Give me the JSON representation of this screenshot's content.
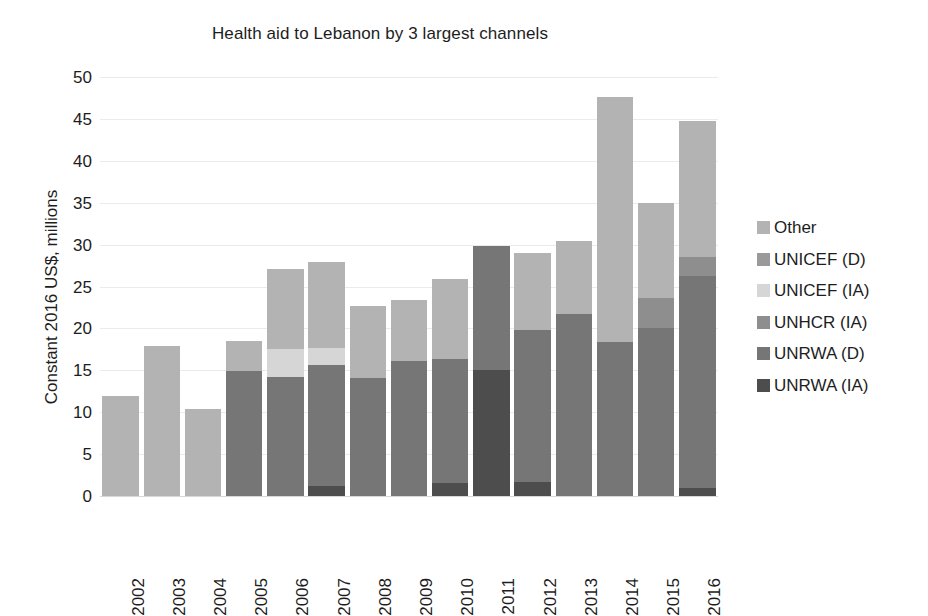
{
  "chart_data": {
    "type": "bar",
    "stacked": true,
    "title": "Health aid to Lebanon by 3 largest channels",
    "xlabel": "",
    "ylabel": "Constant 2016 US$, millions",
    "ylim": [
      0,
      50
    ],
    "ytick_step": 5,
    "yticks": [
      "50",
      "45",
      "40",
      "35",
      "30",
      "25",
      "20",
      "15",
      "10",
      "5",
      "0"
    ],
    "grid": true,
    "legend_position": "right",
    "categories": [
      "2002",
      "2003",
      "2004",
      "2005",
      "2006",
      "2007",
      "2008",
      "2009",
      "2010",
      "2011",
      "2012",
      "2013",
      "2014",
      "2015",
      "2016"
    ],
    "series": [
      {
        "name": "UNRWA (IA)",
        "color": "#4d4d4d",
        "values": [
          0,
          0,
          0,
          0,
          0,
          1.2,
          0,
          0,
          1.6,
          15.0,
          1.7,
          0,
          0,
          0,
          0.9
        ]
      },
      {
        "name": "UNRWA (D)",
        "color": "#767676",
        "values": [
          0,
          0,
          0,
          14.9,
          14.2,
          14.4,
          14.1,
          16.1,
          14.8,
          14.8,
          18.1,
          21.7,
          18.4,
          20.0,
          25.4
        ]
      },
      {
        "name": "UNHCR (IA)",
        "color": "#8e8e8e",
        "values": [
          0,
          0,
          0,
          0,
          0,
          0,
          0,
          0,
          0,
          0,
          0,
          0,
          0,
          3.6,
          2.2
        ]
      },
      {
        "name": "UNICEF (IA)",
        "color": "#d6d6d6",
        "values": [
          0,
          0,
          0,
          0,
          3.3,
          2.1,
          0,
          0,
          0,
          0,
          0,
          0,
          0,
          0,
          0
        ]
      },
      {
        "name": "UNICEF (D)",
        "color": "#9a9a9a",
        "values": [
          0,
          0,
          0,
          0,
          0,
          0,
          0,
          0,
          0,
          0,
          0,
          0,
          0,
          0,
          0
        ]
      },
      {
        "name": "Other",
        "color": "#b3b3b3",
        "values": [
          11.9,
          17.9,
          10.4,
          3.6,
          9.6,
          10.2,
          8.6,
          7.3,
          9.5,
          0,
          9.2,
          8.7,
          29.2,
          11.4,
          16.2
        ]
      }
    ],
    "totals": [
      11.9,
      17.9,
      10.4,
      18.5,
      27.1,
      27.9,
      22.7,
      23.4,
      25.9,
      29.8,
      29.0,
      30.4,
      47.6,
      35.0,
      44.7
    ],
    "legend_entries": [
      {
        "label": "Other",
        "color": "#b3b3b3"
      },
      {
        "label": "UNICEF (D)",
        "color": "#9a9a9a"
      },
      {
        "label": "UNICEF (IA)",
        "color": "#d6d6d6"
      },
      {
        "label": "UNHCR (IA)",
        "color": "#8e8e8e"
      },
      {
        "label": "UNRWA (D)",
        "color": "#767676"
      },
      {
        "label": "UNRWA (IA)",
        "color": "#4d4d4d"
      }
    ]
  }
}
